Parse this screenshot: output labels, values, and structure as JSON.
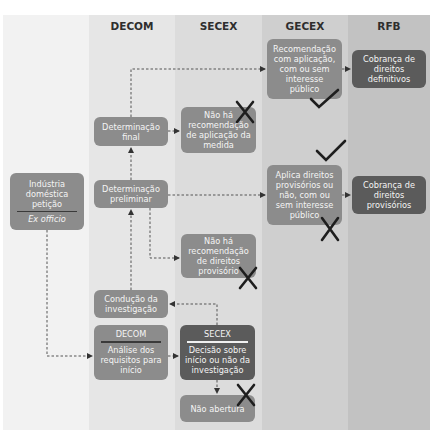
{
  "lanes": [
    {
      "id": "decom",
      "label": "DECOM"
    },
    {
      "id": "secex",
      "label": "SECEX"
    },
    {
      "id": "gecex",
      "label": "GECEX"
    },
    {
      "id": "rfb",
      "label": "RFB"
    }
  ],
  "boxes": {
    "origin": {
      "line1": "Indústria",
      "line2": "doméstica",
      "line3": "petição",
      "alt": "Ex officio"
    },
    "det_final": {
      "line1": "Determinação",
      "line2": "final"
    },
    "det_prelim": {
      "line1": "Determinação",
      "line2": "preliminar"
    },
    "conducao": {
      "line1": "Condução da",
      "line2": "investigação"
    },
    "decom_analise": {
      "header": "DECOM",
      "line1": "Análise dos",
      "line2": "requisitos para",
      "line3": "início"
    },
    "secex_no_rec_final": {
      "line1": "Não há",
      "line2": "recomendação",
      "line3": "de aplicação da",
      "line4": "medida"
    },
    "secex_no_rec_prov": {
      "line1": "Não há",
      "line2": "recomendação",
      "line3": "de direitos",
      "line4": "provisório"
    },
    "secex_decisao": {
      "header": "SECEX",
      "line1": "Decisão sobre",
      "line2": "início ou não da",
      "line3": "investigação"
    },
    "nao_abertura": {
      "line1": "Não abertura"
    },
    "gecex_rec": {
      "line1": "Recomendação",
      "line2": "com aplicação,",
      "line3": "com ou sem",
      "line4": "interesse",
      "line5": "público"
    },
    "gecex_prov": {
      "line1": "Aplica direitos",
      "line2": "provisórios ou",
      "line3": "não, com ou",
      "line4": "sem interesse",
      "line5": "público"
    },
    "rfb_def": {
      "line1": "Cobrança de",
      "line2": "direitos",
      "line3": "definitivos"
    },
    "rfb_prov": {
      "line1": "Cobrança de",
      "line2": "direitos",
      "line3": "provisórios"
    }
  },
  "colors": {
    "lane_decom": "#e6e6e6",
    "lane_secex": "#dcdcdc",
    "lane_gecex": "#cfcfcf",
    "lane_rfb": "#c2c2c2",
    "box_mid": "#8c8c8c",
    "box_dark": "#5b5b5b",
    "connector": "#555555",
    "mark": "#1e1e1e"
  }
}
